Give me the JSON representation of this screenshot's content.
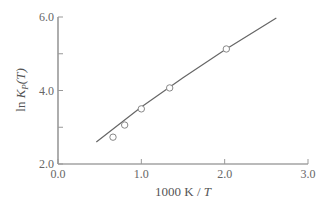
{
  "chart_data": {
    "type": "scatter",
    "title": "",
    "xlabel": "1000 K / T",
    "ylabel": "ln K_P(T)",
    "xlim": [
      0.0,
      3.0
    ],
    "ylim": [
      2.0,
      6.0
    ],
    "x_ticks": [
      "0.0",
      "1.0",
      "2.0",
      "3.0"
    ],
    "y_ticks": [
      "2.0",
      "4.0",
      "6.0"
    ],
    "grid": false,
    "legend": null,
    "series": [
      {
        "name": "measured",
        "marker": "open-circle",
        "x": [
          0.66,
          0.8,
          1.0,
          1.34,
          2.02
        ],
        "y": [
          2.73,
          3.06,
          3.5,
          4.07,
          5.13
        ]
      },
      {
        "name": "fit",
        "style": "line",
        "x": [
          0.46,
          1.0,
          1.5,
          2.0,
          2.62
        ],
        "y": [
          2.6,
          3.55,
          4.35,
          5.1,
          5.97
        ]
      }
    ]
  },
  "axes": {
    "x_label_main": "1000 K / ",
    "x_label_italic": "T",
    "y_label_ln": "ln ",
    "y_label_K": "K",
    "y_label_sub": "P",
    "y_label_arg": "(T)"
  }
}
